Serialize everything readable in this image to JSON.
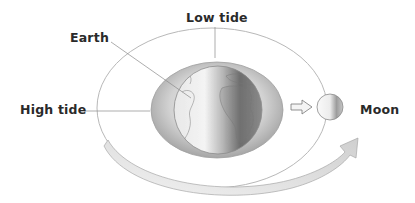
{
  "diagram": {
    "type": "tidal-bulge-illustration",
    "labels": {
      "low_tide": "Low tide",
      "earth": "Earth",
      "high_tide": "High tide",
      "moon": "Moon"
    },
    "elements": {
      "orbit": "thin elliptical orbit line around Earth",
      "tidal_bulge": "elongated ocean bulge ellipse around Earth, stretched toward Moon",
      "earth": "shaded globe showing Americas/Africa, half in shadow",
      "pull_arrow": "small hollow arrow pointing from Earth toward Moon",
      "moon": "small shaded sphere",
      "rotation_arrow": "large curved grey arrow indicating Moon's orbital motion"
    },
    "colors": {
      "text": "#2a2a2a",
      "leader_line": "#8a8a8a",
      "orbit": "#b5b5b5",
      "arrow_fill": "#e4e4e4"
    }
  }
}
